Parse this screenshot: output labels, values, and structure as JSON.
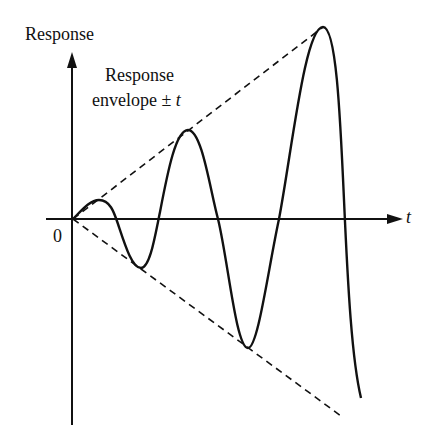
{
  "figure": {
    "y_axis_label": "Response",
    "x_axis_label": "t",
    "origin_label": "0",
    "envelope_label_line1": "Response",
    "envelope_label_line2_prefix": "envelope ± ",
    "envelope_label_line2_var": "t"
  },
  "colors": {
    "ink": "#111111",
    "background": "#ffffff"
  },
  "geometry": {
    "origin": [
      73,
      219
    ],
    "curve_extrema": [
      [
        73,
        219
      ],
      [
        99,
        200
      ],
      [
        141,
        268
      ],
      [
        188,
        130
      ],
      [
        248,
        348
      ],
      [
        323,
        27
      ],
      [
        361,
        398
      ]
    ],
    "zero_crossings_x": [
      116,
      159,
      218,
      279,
      346
    ],
    "upper_envelope_end": [
      323,
      27
    ],
    "lower_envelope_end": [
      341,
      415
    ]
  }
}
